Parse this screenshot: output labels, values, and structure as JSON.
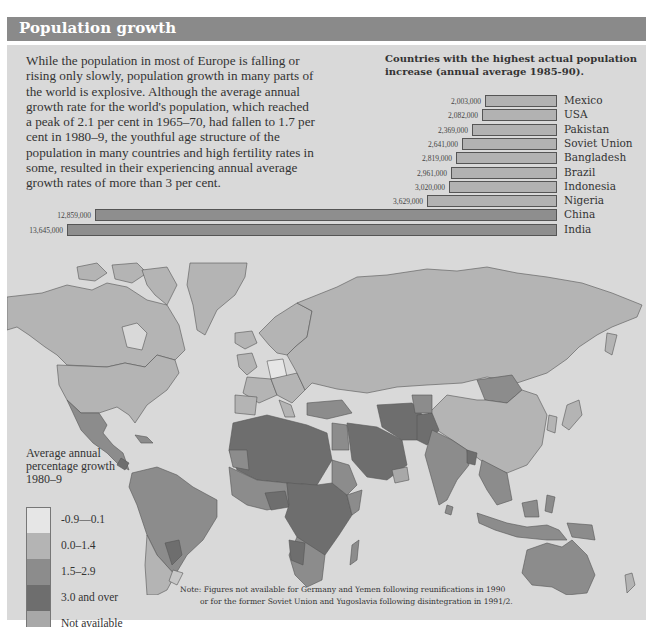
{
  "header": {
    "title": "Population growth"
  },
  "intro_text": "While the population in most of Europe is falling or rising only slowly, population growth in many parts of the world is explosive. Although the average annual growth rate for the world's population, which reached a peak of 2.1 per cent in 1965–70, had fallen to 1.7 per cent in 1980–9, the youthful age structure of the population in many countries and high fertility rates in some, resulted in their experiencing annual average growth rates of more than 3 per cent.",
  "chart_data": {
    "type": "bar",
    "orientation": "horizontal",
    "title": "Countries with the highest actual population increase (annual average 1985-90).",
    "xlabel": "",
    "ylabel": "",
    "categories": [
      "Mexico",
      "USA",
      "Pakistan",
      "Soviet Union",
      "Bangladesh",
      "Brazil",
      "Indonesia",
      "Nigeria",
      "China",
      "India"
    ],
    "values": [
      2003000,
      2082000,
      2369000,
      2641000,
      2819000,
      2961000,
      3020000,
      3629000,
      12859000,
      13645000
    ],
    "value_labels": [
      "2,003,000",
      "2,082,000",
      "2,369,000",
      "2,641,000",
      "2,819,000",
      "2,961,000",
      "3,020,000",
      "3,629,000",
      "12,859,000",
      "13,645,000"
    ],
    "grid": false,
    "legend": null,
    "bar_alignment": "right-aligned bars, labels to the right"
  },
  "map": {
    "legend": {
      "title": "Average annual percentage growth 1980–9",
      "items": [
        {
          "label": "-0.9—0.1",
          "color": "#e6e6e6"
        },
        {
          "label": "0.0–1.4",
          "color": "#b4b4b4"
        },
        {
          "label": "1.5–2.9",
          "color": "#8c8c8c"
        },
        {
          "label": "3.0 and over",
          "color": "#6e6e6e"
        },
        {
          "label": "Not available",
          "color": "#a8a8a8"
        }
      ]
    },
    "note_line1": "Note: Figures not available for Germany and Yemen following reunifications in 1990",
    "note_line2": "or for the former Soviet Union and Yugoslavia following disintegration in 1991/2."
  },
  "colors": {
    "header_bg": "#8a8a8a",
    "panel_bg": "#d9d9d9",
    "ocean": "#d9d9d9",
    "bar_fill": "#b2b2b2",
    "bar_fill_large": "#8e8e8e"
  }
}
